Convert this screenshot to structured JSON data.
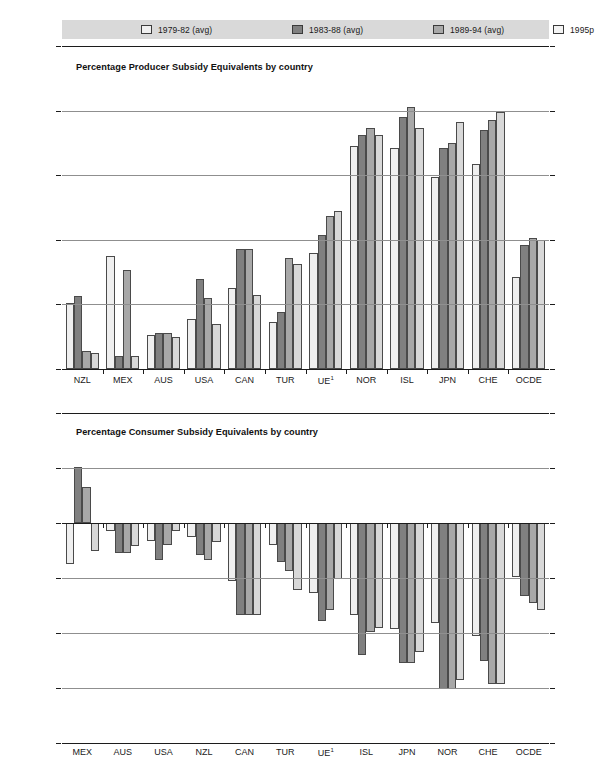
{
  "legend": {
    "items": [
      {
        "label": "1979-82 (avg)",
        "color": "#efefef"
      },
      {
        "label": "1983-88 (avg)",
        "color": "#808080"
      },
      {
        "label": "1989-94 (avg)",
        "color": "#a8a8a8"
      },
      {
        "label": "1995p",
        "color": "#f4f4f4"
      }
    ],
    "background": "#d9d9d9"
  },
  "chart_data": [
    {
      "id": "producer",
      "type": "bar",
      "title": "Percentage Producer Subsidy Equivalents by country",
      "xlabel": "",
      "ylabel": "",
      "ylim": [
        0,
        100
      ],
      "yticks": [
        0,
        20,
        40,
        60,
        80,
        100
      ],
      "ytick_labels": [
        "0",
        "20",
        "40",
        "60",
        "80",
        "100"
      ],
      "grid": true,
      "legend_position": "top",
      "categories": [
        "NZL",
        "MEX",
        "AUS",
        "USA",
        "CAN",
        "TUR",
        "UE¹",
        "NOR",
        "ISL",
        "JPN",
        "CHE",
        "OCDE"
      ],
      "series": [
        {
          "name": "1979-82 (avg)",
          "color": "#efefef",
          "values": [
            20.5,
            35.0,
            10.5,
            15.5,
            25.0,
            14.5,
            36.0,
            69.0,
            68.5,
            59.5,
            63.5,
            28.5
          ]
        },
        {
          "name": "1983-88 (avg)",
          "color": "#808080",
          "values": [
            22.5,
            4.0,
            11.0,
            28.0,
            37.0,
            17.5,
            41.5,
            72.5,
            78.0,
            68.5,
            74.0,
            38.5
          ]
        },
        {
          "name": "1989-94 (avg)",
          "color": "#a8a8a8",
          "values": [
            5.5,
            30.5,
            11.0,
            22.0,
            37.0,
            34.5,
            47.5,
            74.5,
            81.0,
            70.0,
            77.0,
            40.5
          ]
        },
        {
          "name": "1995p",
          "color": "#d8d8d8",
          "values": [
            5.0,
            4.0,
            10.0,
            14.0,
            23.0,
            32.5,
            49.0,
            72.5,
            74.5,
            76.5,
            79.5,
            40.0
          ]
        }
      ]
    },
    {
      "id": "consumer",
      "type": "bar",
      "title": "Percentage Consumer Subsidy Equivalents by country",
      "xlabel": "",
      "ylabel": "",
      "ylim": [
        -80,
        40
      ],
      "yticks": [
        -80,
        -60,
        -40,
        -20,
        0,
        20,
        40
      ],
      "ytick_labels": [
        "-80",
        "-60",
        "-40",
        "-20",
        "0",
        "20",
        "40"
      ],
      "grid": true,
      "legend_position": "top",
      "categories": [
        "MEX",
        "AUS",
        "USA",
        "NZL",
        "CAN",
        "TUR",
        "UE¹",
        "ISL",
        "JPN",
        "NOR",
        "CHE",
        "OCDE"
      ],
      "series": [
        {
          "name": "1979-82 (avg)",
          "color": "#efefef",
          "values": [
            -15.0,
            -3.0,
            -6.5,
            -5.0,
            -21.0,
            -8.0,
            -25.5,
            -33.5,
            -38.5,
            -36.5,
            -41.0,
            -19.5
          ]
        },
        {
          "name": "1983-88 (avg)",
          "color": "#808080",
          "values": [
            20.5,
            -11.0,
            -13.5,
            -11.5,
            -33.5,
            -14.0,
            -35.5,
            -48.0,
            -51.0,
            -60.5,
            -50.0,
            -26.5
          ]
        },
        {
          "name": "1989-94 (avg)",
          "color": "#a8a8a8",
          "values": [
            13.0,
            -11.0,
            -8.0,
            -13.5,
            -33.5,
            -17.5,
            -31.5,
            -39.5,
            -51.0,
            -60.5,
            -58.5,
            -29.0
          ]
        },
        {
          "name": "1995p",
          "color": "#d8d8d8",
          "values": [
            -10.0,
            -8.5,
            -3.0,
            -7.0,
            -33.5,
            -24.5,
            -20.5,
            -38.0,
            -47.0,
            -57.0,
            -58.5,
            -31.5
          ]
        }
      ]
    }
  ]
}
